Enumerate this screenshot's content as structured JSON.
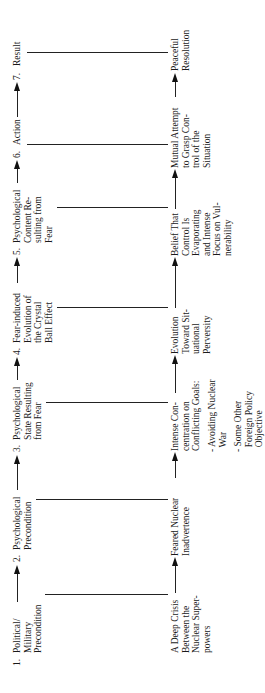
{
  "diagram": {
    "orientation": "rotated 90 degrees counterclockwise",
    "stages": [
      {
        "number": "1.",
        "label": "Political/\nMilitary\nPrecondition",
        "outcome": "A Deep Crisis\nBetween the\nNuclear Super-\npowers"
      },
      {
        "number": "2.",
        "label": "Psychological\nPrecondition",
        "outcome": "Feared Nuclear\nInadvertence"
      },
      {
        "number": "3.",
        "label": "Psychological\nState Resulting\nfrom Fear",
        "outcome": "Intense Con-\ncentration on\nConflicting Goals:"
      },
      {
        "number": "4.",
        "label": "Fear-induced\nEvolution of\nthe Crystal\nBall Effect",
        "outcome": "Evolution\nToward Sit-\nuational\nPerversity"
      },
      {
        "number": "5.",
        "label": "Psychological\nContent Re-\nsulting from\nFear",
        "outcome": "Belief That\nControl Is\nEvaporating\nand Intense\nFocus on Vul-\nnerability"
      },
      {
        "number": "6.",
        "label": "Action",
        "outcome": "Mutual Attempt\nto Grasp Con-\ntrol of the\nSituation"
      },
      {
        "number": "7.",
        "label": "Result",
        "outcome": "Peaceful\nResolution"
      }
    ],
    "conflicting_goals": [
      "- Avoiding Nuclear\n  War",
      "- Some Other\n  Foreign Policy\n  Objective"
    ],
    "colors": {
      "line": "#222222",
      "text": "#1a1a1a",
      "background": "#ffffff"
    }
  }
}
